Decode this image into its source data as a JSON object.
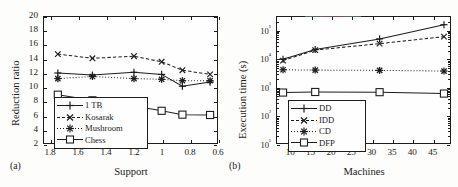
{
  "figure": {
    "subcaption_a": "(a)",
    "subcaption_b": "(b)"
  },
  "chart_data": [
    {
      "id": "chart-a",
      "type": "line",
      "title": "",
      "xlabel": "Support",
      "ylabel": "Reduction ratio",
      "x": [
        1.75,
        1.5,
        1.2,
        1.0,
        0.85,
        0.65
      ],
      "xlim": [
        1.85,
        0.6
      ],
      "ylim": [
        2,
        20
      ],
      "xticks": [
        "1.8",
        "1.6",
        "1.4",
        "1.2",
        "1",
        "0.8",
        "0.6"
      ],
      "xtick_values": [
        1.8,
        1.6,
        1.4,
        1.2,
        1.0,
        0.8,
        0.6
      ],
      "yticks": [
        "2",
        "4",
        "6",
        "8",
        "10",
        "12",
        "14",
        "16",
        "18",
        "20"
      ],
      "ytick_values": [
        2,
        4,
        6,
        8,
        10,
        12,
        14,
        16,
        18,
        20
      ],
      "grid": false,
      "legend_position": "lower-left",
      "series": [
        {
          "name": "1 TB",
          "marker": "plus",
          "line": "solid",
          "values": [
            12.0,
            11.7,
            12.1,
            11.8,
            10.1,
            10.7
          ]
        },
        {
          "name": "Kosarak",
          "marker": "cross",
          "line": "dashed",
          "values": [
            14.7,
            14.1,
            14.4,
            13.6,
            12.4,
            11.8
          ]
        },
        {
          "name": "Mushroom",
          "marker": "asterisk",
          "line": "dotted",
          "values": [
            11.2,
            11.5,
            11.2,
            11.1,
            10.9,
            10.9
          ]
        },
        {
          "name": "Chess",
          "marker": "square",
          "line": "solid",
          "values": [
            8.9,
            8.1,
            7.3,
            6.6,
            6.05,
            6.0
          ]
        }
      ]
    },
    {
      "id": "chart-b",
      "type": "line",
      "title": "",
      "xlabel": "Machines",
      "ylabel": "Execution time (s)",
      "x": [
        8,
        16,
        32,
        48
      ],
      "xlim": [
        6.5,
        49.5
      ],
      "ylim": [
        10,
        300000
      ],
      "yscale": "log",
      "xticks": [
        "10",
        "15",
        "20",
        "25",
        "30",
        "35",
        "40",
        "45"
      ],
      "xtick_values": [
        10,
        15,
        20,
        25,
        30,
        35,
        40,
        45
      ],
      "yticks": [
        "10¹",
        "10²",
        "10³",
        "10⁴",
        "10⁵"
      ],
      "ytick_values": [
        10,
        100,
        1000,
        10000,
        100000
      ],
      "grid": false,
      "legend_position": "lower-left",
      "series": [
        {
          "name": "DD",
          "marker": "plus",
          "line": "solid",
          "values": [
            9500,
            21000,
            50000,
            160000
          ]
        },
        {
          "name": "IDD",
          "marker": "cross",
          "line": "dashed",
          "values": [
            8500,
            20000,
            34000,
            60000
          ]
        },
        {
          "name": "CD",
          "marker": "asterisk",
          "line": "dotted",
          "values": [
            4000,
            3900,
            3800,
            3600
          ]
        },
        {
          "name": "DFP",
          "marker": "square",
          "line": "solid",
          "values": [
            620,
            650,
            640,
            570
          ]
        }
      ]
    }
  ],
  "colors": {
    "ink": "#1d1d1d",
    "paper": "#fdfdfb"
  }
}
